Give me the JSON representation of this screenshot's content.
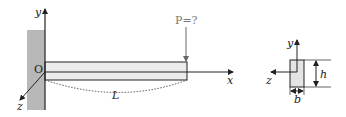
{
  "diagram": {
    "type": "cantilever-beam",
    "labels": {
      "origin": "O",
      "y_axis": "y",
      "x_axis": "x",
      "z_axis": "z",
      "length": "L",
      "load": "P=?"
    },
    "cross_section": {
      "y_axis": "y",
      "z_axis": "z",
      "height": "h",
      "width": "b"
    },
    "colors": {
      "wall": "#b8b8b8",
      "beam_fill": "#ececec",
      "line": "#222222",
      "load": "#777777"
    }
  }
}
